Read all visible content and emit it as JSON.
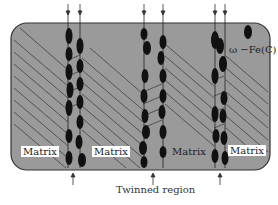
{
  "diagram": {
    "labels": {
      "matrix_1": "Matrix",
      "matrix_2": "Matrix",
      "matrix_3": "Matrix",
      "matrix_4": "Matrix",
      "legend": "ω −Fe(C)",
      "caption": "Twinned region"
    },
    "colors": {
      "background_box": "#9a9a9a",
      "box_border": "#333333",
      "hatch": "#333333",
      "particles": "#111111"
    },
    "twinned_bands": [
      {
        "name": "band-1",
        "x_left": 68,
        "x_right": 80
      },
      {
        "name": "band-2",
        "x_left": 143,
        "x_right": 162
      },
      {
        "name": "band-3",
        "x_left": 214,
        "x_right": 224
      }
    ]
  }
}
